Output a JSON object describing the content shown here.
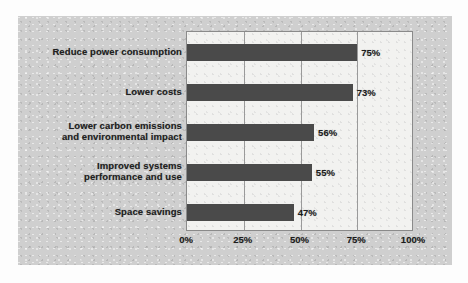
{
  "chart_data": {
    "type": "bar",
    "orientation": "horizontal",
    "title": "",
    "subtitle": "",
    "xlabel": "",
    "ylabel": "",
    "categories": [
      "Reduce power consumption",
      "Lower costs",
      "Lower carbon emissions and environmental impact",
      "Improved systems performance and use",
      "Space savings"
    ],
    "category_lines": [
      [
        "Reduce power consumption"
      ],
      [
        "Lower costs"
      ],
      [
        "Lower carbon emissions",
        "and environmental impact"
      ],
      [
        "Improved systems",
        "performance and use"
      ],
      [
        "Space savings"
      ]
    ],
    "values": [
      75,
      73,
      56,
      55,
      47
    ],
    "value_labels": [
      "75%",
      "73%",
      "56%",
      "55%",
      "47%"
    ],
    "xlim": [
      0,
      100
    ],
    "xticks": [
      0,
      25,
      50,
      75,
      100
    ],
    "xtick_labels": [
      "0%",
      "25%",
      "50%",
      "75%",
      "100%"
    ],
    "grid": true,
    "grid_axis": "x",
    "legend": false,
    "legend_position": "none",
    "colors": {
      "bar": "#4a4a4a",
      "plot_background": "#f2f2f0",
      "panel_background": "#cfcfcf",
      "gridline": "#9a9a9a",
      "axis_border": "#8a8a8a",
      "text": "#1c1c1c"
    }
  }
}
